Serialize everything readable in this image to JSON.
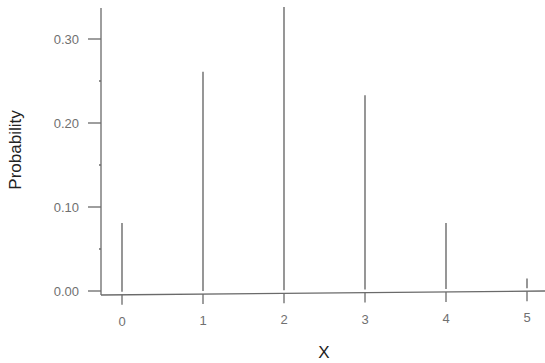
{
  "chart_data": {
    "type": "bar",
    "style": "spike",
    "title": "",
    "xlabel": "X",
    "ylabel": "Probability",
    "categories": [
      "0",
      "1",
      "2",
      "3",
      "4",
      "5"
    ],
    "x": [
      0,
      1,
      2,
      3,
      4,
      5
    ],
    "values": [
      0.081,
      0.261,
      0.338,
      0.233,
      0.081,
      0.015
    ],
    "ylim": [
      0,
      0.34
    ],
    "xlim": [
      -0.25,
      5
    ],
    "yticks": [
      0.0,
      0.1,
      0.2,
      0.3
    ],
    "ytick_labels": [
      "0.00",
      "0.10",
      "0.20",
      "0.30"
    ],
    "yminor_ticks": [
      0.05,
      0.15,
      0.25
    ],
    "xticks": [
      0,
      1,
      2,
      3,
      4,
      5
    ],
    "xtick_labels": [
      "0",
      "1",
      "2",
      "3",
      "4",
      "5"
    ],
    "grid": false,
    "legend": null,
    "colors": {
      "line": "#6a6a6a",
      "tick_text": "#707070",
      "title_text": "#222222"
    }
  }
}
